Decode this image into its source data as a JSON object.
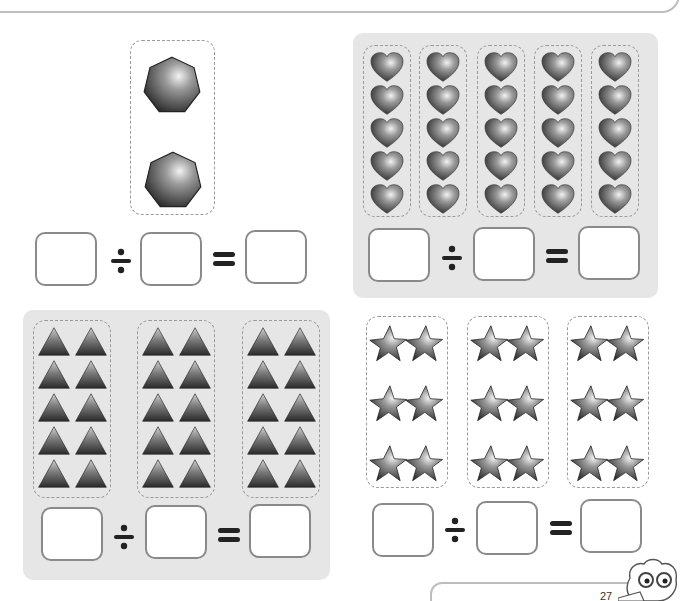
{
  "page": {
    "type": "division-worksheet",
    "colors": {
      "panel_fill": "#e6e6e6",
      "dash_border": "#9a9a9a",
      "box_border": "#8a8a8a",
      "shape_dark": "#3a3a3a",
      "shape_light": "#d8d8d8"
    }
  },
  "problems": [
    {
      "id": "heptagons",
      "shape": "heptagon",
      "groups": 1,
      "items_per_group": 2,
      "total": 2,
      "background": "white",
      "equation": {
        "dividend": "",
        "divisor": "",
        "quotient": "",
        "divide_symbol": "÷",
        "equals_symbol": "="
      }
    },
    {
      "id": "hearts",
      "shape": "heart",
      "groups": 5,
      "items_per_group": 5,
      "total": 25,
      "background": "gray",
      "equation": {
        "dividend": "",
        "divisor": "",
        "quotient": "",
        "divide_symbol": "÷",
        "equals_symbol": "="
      }
    },
    {
      "id": "triangles",
      "shape": "triangle",
      "groups": 3,
      "items_per_group": 10,
      "total": 30,
      "background": "gray",
      "equation": {
        "dividend": "",
        "divisor": "",
        "quotient": "",
        "divide_symbol": "÷",
        "equals_symbol": "="
      }
    },
    {
      "id": "stars",
      "shape": "star",
      "groups": 3,
      "items_per_group": 6,
      "total": 18,
      "background": "white",
      "equation": {
        "dividend": "",
        "divisor": "",
        "quotient": "",
        "divide_symbol": "÷",
        "equals_symbol": "="
      }
    }
  ],
  "footer": {
    "page_number": "27"
  }
}
